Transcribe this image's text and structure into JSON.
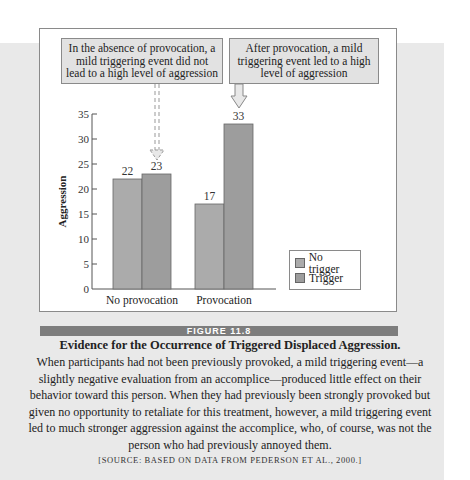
{
  "callouts": [
    {
      "text": "In the absence of provocation, a mild triggering event did not lead to a high level of aggression"
    },
    {
      "text": "After provocation, a mild triggering event led to a high level of aggression"
    }
  ],
  "figure": {
    "label": "FIGURE 11.8",
    "title": "Evidence for the Occurrence of Triggered Displaced Aggression.",
    "body": "When participants had not been previously provoked, a mild triggering event—a slightly negative evaluation from an accomplice—produced little effect on their behavior toward this person. When they had previously been strongly provoked but given no opportunity to retaliate for this treatment, however, a mild triggering event led to much stronger aggression against the accomplice, who, of course, was not the person who had previously annoyed them.",
    "source": "[SOURCE: BASED ON DATA FROM PEDERSON ET AL., 2000.]"
  },
  "colors": {
    "no_trigger": "#ababab",
    "trigger": "#9d9d9d",
    "band": "#e9e9e9",
    "figure_bar": "#7d7d7d"
  },
  "chart_data": {
    "type": "bar",
    "title": "",
    "xlabel": "",
    "ylabel": "Aggression",
    "categories": [
      "No provocation",
      "Provocation"
    ],
    "series": [
      {
        "name": "No trigger",
        "values": [
          22,
          17
        ]
      },
      {
        "name": "Trigger",
        "values": [
          23,
          33
        ]
      }
    ],
    "ylim": [
      0,
      35
    ],
    "yticks": [
      0,
      5,
      10,
      15,
      20,
      25,
      30,
      35
    ],
    "grid": false,
    "legend_position": "lower right",
    "annotations": [
      "In the absence of provocation, a mild triggering event did not lead to a high level of aggression",
      "After provocation, a mild triggering event led to a high level of aggression"
    ]
  }
}
